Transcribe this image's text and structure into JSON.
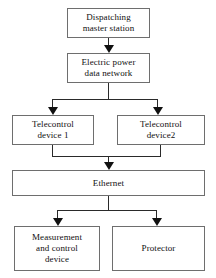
{
  "diagram": {
    "background_color": "#ffffff",
    "box_border_color": "#6e6e6e",
    "connector_color": "#2a2a2a",
    "text_color": "#0f0f0f",
    "nodes": [
      {
        "id": "dispatching-master-station",
        "label": "Dispatching\nmaster station"
      },
      {
        "id": "electric-power-data-network",
        "label": "Electric power\ndata network"
      },
      {
        "id": "telecontrol-device-1",
        "label": "Telecontrol\ndevice 1"
      },
      {
        "id": "telecontrol-device-2",
        "label": "Telecontrol\ndevice2"
      },
      {
        "id": "ethernet",
        "label": "Ethernet"
      },
      {
        "id": "measurement-and-control-device",
        "label": "Measurement\nand control\ndevice"
      },
      {
        "id": "protector",
        "label": "Protector"
      }
    ],
    "edges": [
      {
        "from": "dispatching-master-station",
        "to": "electric-power-data-network"
      },
      {
        "from": "electric-power-data-network",
        "to": "telecontrol-device-1"
      },
      {
        "from": "electric-power-data-network",
        "to": "telecontrol-device-2"
      },
      {
        "from": "telecontrol-device-1",
        "to": "ethernet"
      },
      {
        "from": "telecontrol-device-2",
        "to": "ethernet"
      },
      {
        "from": "ethernet",
        "to": "measurement-and-control-device"
      },
      {
        "from": "ethernet",
        "to": "protector"
      }
    ]
  }
}
